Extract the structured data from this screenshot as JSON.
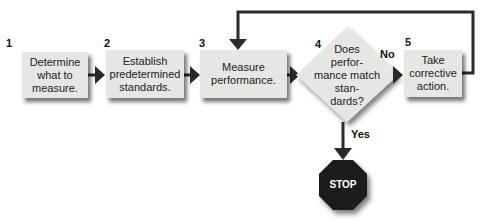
{
  "diagram": {
    "type": "flowchart",
    "steps": [
      {
        "number": "1",
        "label": "Determine what to measure."
      },
      {
        "number": "2",
        "label": "Establish predetermined standards."
      },
      {
        "number": "3",
        "label": "Measure performance."
      },
      {
        "number": "4",
        "label": "Does perfor- mance match stan- dards?"
      },
      {
        "number": "5",
        "label": "Take corrective action."
      }
    ],
    "lines": {
      "s1": [
        "Determine",
        "what to",
        "measure."
      ],
      "s2": [
        "Establish",
        "predetermined",
        "standards."
      ],
      "s3": [
        "Measure",
        "performance."
      ],
      "s4": [
        "Does",
        "perfor-",
        "mance match",
        "stan-",
        "dards?"
      ],
      "s5": [
        "Take",
        "corrective",
        "action."
      ]
    },
    "branch_no": "No",
    "branch_yes": "Yes",
    "end": "STOP",
    "colors": {
      "box": "#e6e6e4",
      "arrow": "#2a2a2a",
      "stop": "#1a1a1a"
    }
  }
}
